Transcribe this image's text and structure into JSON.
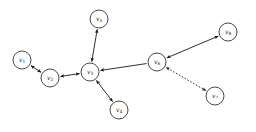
{
  "figure": {
    "background_color": "#ffffff",
    "stroke_color": "#1a1a1a",
    "width": 256,
    "height": 132
  },
  "nodes": [
    {
      "id": "v1",
      "label": "v",
      "sub": "1",
      "cx": 22,
      "cy": 60,
      "r": 9
    },
    {
      "id": "v2",
      "label": "v",
      "sub": "2",
      "cx": 50,
      "cy": 78,
      "r": 9
    },
    {
      "id": "v3",
      "label": "v",
      "sub": "3",
      "cx": 90,
      "cy": 72,
      "r": 9
    },
    {
      "id": "v4",
      "label": "v",
      "sub": "4",
      "cx": 119,
      "cy": 110,
      "r": 9
    },
    {
      "id": "v5",
      "label": "v",
      "sub": "5",
      "cx": 99,
      "cy": 19,
      "r": 9
    },
    {
      "id": "v6",
      "label": "v",
      "sub": "6",
      "cx": 157,
      "cy": 62,
      "r": 9
    },
    {
      "id": "v7",
      "label": "v",
      "sub": "7",
      "cx": 215,
      "cy": 96,
      "r": 9
    },
    {
      "id": "v8",
      "label": "v",
      "sub": "8",
      "cx": 228,
      "cy": 32,
      "r": 9
    }
  ],
  "edges": [
    {
      "id": "e-v1-v2",
      "from": "v1",
      "to": "v2",
      "style": "solid",
      "arrow": "both"
    },
    {
      "id": "e-v2-v3",
      "from": "v2",
      "to": "v3",
      "style": "solid",
      "arrow": "both"
    },
    {
      "id": "e-v3-v5",
      "from": "v3",
      "to": "v5",
      "style": "solid",
      "arrow": "both"
    },
    {
      "id": "e-v3-v4",
      "from": "v3",
      "to": "v4",
      "style": "solid",
      "arrow": "both"
    },
    {
      "id": "e-v6-v3",
      "from": "v6",
      "to": "v3",
      "style": "solid",
      "arrow": "end"
    },
    {
      "id": "e-v8-v6",
      "from": "v8",
      "to": "v6",
      "style": "solid",
      "arrow": "both"
    },
    {
      "id": "e-v7-v6",
      "from": "v7",
      "to": "v6",
      "style": "dotted",
      "arrow": "both"
    }
  ]
}
